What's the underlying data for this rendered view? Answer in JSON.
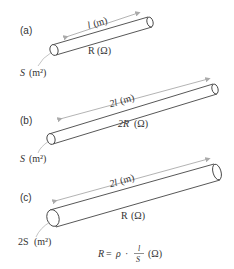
{
  "panels": [
    {
      "id": "a",
      "label": "(a)",
      "length_label": "l",
      "length_unit": "(m)",
      "resistance_label": "R",
      "resistance_unit": "(Ω)",
      "area_label": "S",
      "area_unit": "(m²)"
    },
    {
      "id": "b",
      "label": "(b)",
      "length_label": "2l",
      "length_unit": "(m)",
      "resistance_label": "2R",
      "resistance_unit": "(Ω)",
      "area_label": "S",
      "area_unit": "(m²)"
    },
    {
      "id": "c",
      "label": "(c)",
      "length_label": "2l",
      "length_unit": "(m)",
      "resistance_label": "R",
      "resistance_unit": "(Ω)",
      "area_label": "2S",
      "area_unit": "(m²)"
    }
  ],
  "formula": {
    "lhs": "R",
    "eq": "=",
    "rho": "ρ",
    "dot": "·",
    "numerator": "l",
    "denominator": "S",
    "unit": "(Ω)"
  }
}
